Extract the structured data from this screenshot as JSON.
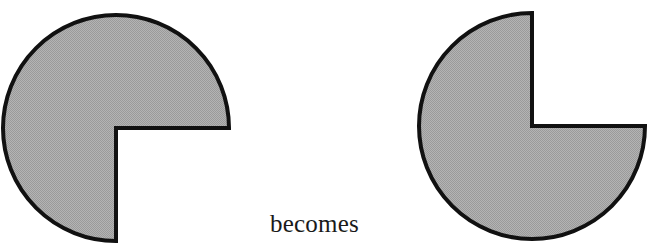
{
  "figure": {
    "background_color": "#ffffff",
    "caption": {
      "text": "becomes",
      "x": 270,
      "y": 209,
      "font_size_px": 25,
      "color": "#1a1a1a"
    },
    "shapes": [
      {
        "id": "left-pacman",
        "name": "left-notched-disc",
        "type": "circle-with-quarter-notch",
        "center": {
          "x": 116,
          "y": 128
        },
        "radius": 113,
        "fill_color": "#a8a8a8",
        "stroke_color": "#111111",
        "stroke_width": 4,
        "notch": {
          "description": "quarter wedge removed from upper-right quadrant",
          "start_angle_deg": 0,
          "end_angle_deg": 270,
          "opening_direction": "upper-right",
          "inner_corner": {
            "x": 116,
            "y": 128
          },
          "arm_tip_up": {
            "x": 116,
            "y": 15
          },
          "arm_tip_right": {
            "x": 229,
            "y": 128
          }
        }
      },
      {
        "id": "right-pacman",
        "name": "right-notched-disc",
        "type": "circle-with-quarter-notch",
        "center": {
          "x": 532,
          "y": 126
        },
        "radius": 113,
        "fill_color": "#a8a8a8",
        "stroke_color": "#111111",
        "stroke_width": 4,
        "notch": {
          "description": "quarter wedge removed from lower-left quadrant (rotated 90 degrees from left shape)",
          "start_angle_deg": 90,
          "end_angle_deg": 360,
          "opening_direction": "lower-left",
          "inner_corner": {
            "x": 532,
            "y": 126
          },
          "arm_tip_left": {
            "x": 419,
            "y": 126
          },
          "arm_tip_down": {
            "x": 532,
            "y": 239
          }
        }
      }
    ]
  },
  "colors": {
    "shape_fill": "#a8a8a8",
    "shape_outline": "#111111",
    "page_background": "#ffffff",
    "text": "#1a1a1a"
  }
}
